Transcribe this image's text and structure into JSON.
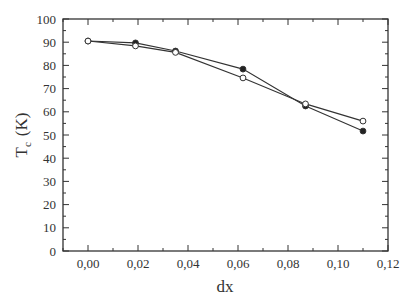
{
  "chart_data": {
    "type": "line",
    "title": "",
    "xlabel": "dx",
    "ylabel": "T_c (K)",
    "ylabel_main": "T",
    "ylabel_sub": "c",
    "ylabel_unit": "(K)",
    "xlim": [
      -0.01,
      0.12
    ],
    "ylim": [
      0,
      100
    ],
    "xticks": [
      0.0,
      0.02,
      0.04,
      0.06,
      0.08,
      0.1,
      0.12
    ],
    "xtick_labels": [
      "0,00",
      "0,02",
      "0,04",
      "0,06",
      "0,08",
      "0,10",
      "0,12"
    ],
    "xminor": [
      -0.01,
      0.01,
      0.03,
      0.05,
      0.07,
      0.09,
      0.11
    ],
    "yticks": [
      0,
      10,
      20,
      30,
      40,
      50,
      60,
      70,
      80,
      90,
      100
    ],
    "ytick_labels": [
      "0",
      "10",
      "20",
      "30",
      "40",
      "50",
      "60",
      "70",
      "80",
      "90",
      "100"
    ],
    "yminor": [
      5,
      15,
      25,
      35,
      45,
      55,
      65,
      75,
      85,
      95
    ],
    "grid": false,
    "legend": null,
    "series": [
      {
        "name": "filled circles",
        "marker": "filled-circle",
        "x": [
          0.0,
          0.019,
          0.035,
          0.062,
          0.087,
          0.11
        ],
        "values": [
          90.5,
          89.7,
          86.2,
          78.4,
          62.5,
          51.7
        ]
      },
      {
        "name": "open circles",
        "marker": "open-circle",
        "x": [
          0.0,
          0.019,
          0.035,
          0.062,
          0.087,
          0.11
        ],
        "values": [
          90.5,
          88.4,
          85.6,
          74.6,
          63.4,
          56.0
        ]
      }
    ],
    "colors": {
      "axis": "#333333",
      "line": "#333333",
      "marker_fill": "#222222",
      "marker_open_fill": "#ffffff"
    }
  }
}
